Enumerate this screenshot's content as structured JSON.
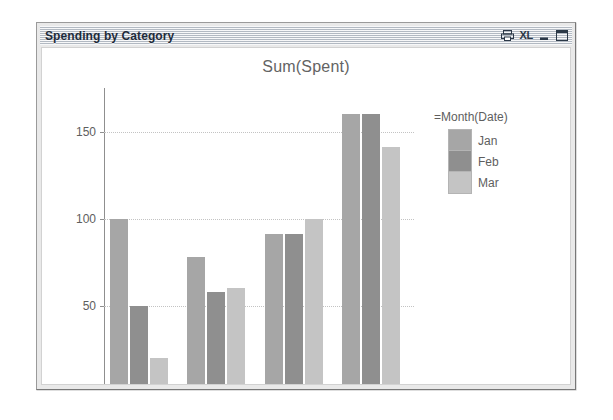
{
  "window": {
    "title": "Spending by Category",
    "buttons": [
      {
        "name": "print-icon",
        "label": "Print"
      },
      {
        "name": "excel-icon",
        "label": "XL"
      },
      {
        "name": "minimize-icon",
        "label": "Minimize"
      },
      {
        "name": "maximize-icon",
        "label": "Maximize"
      }
    ]
  },
  "legend": {
    "title": "=Month(Date)",
    "entries": [
      {
        "label": "Jan",
        "color": "#a6a6a6"
      },
      {
        "label": "Feb",
        "color": "#8f8f8f"
      },
      {
        "label": "Mar",
        "color": "#c4c4c4"
      }
    ]
  },
  "chart_data": {
    "type": "bar",
    "title": "Sum(Spent)",
    "xlabel": "Category",
    "ylabel": "",
    "categories": [
      "Clothes",
      "Coffee",
      "Food",
      "Petrol"
    ],
    "series": [
      {
        "name": "Jan",
        "color": "#a6a6a6",
        "values": [
          100,
          78,
          91,
          160
        ]
      },
      {
        "name": "Feb",
        "color": "#8f8f8f",
        "values": [
          50,
          58,
          91,
          160
        ]
      },
      {
        "name": "Mar",
        "color": "#c4c4c4",
        "values": [
          20,
          60,
          100,
          141
        ]
      }
    ],
    "ylim": [
      0,
      175
    ],
    "yticks": [
      0,
      50,
      100,
      150
    ],
    "ytick_labels": [
      "0",
      "50",
      "100",
      "150"
    ],
    "grid": true,
    "legend_position": "right"
  }
}
